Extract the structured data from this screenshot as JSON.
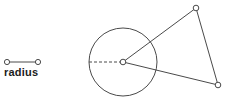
{
  "figure": {
    "width": 228,
    "height": 100,
    "background_color": "#ffffff",
    "stroke_color": "#4a4a4a",
    "text_color": "#1c1c1c",
    "marker_fill_color": "#ffffff"
  },
  "legend": {
    "label": "radius",
    "segment": {
      "x1": 7,
      "y1": 62,
      "x2": 38,
      "y2": 62
    },
    "endpoint_markers": [
      {
        "name": "legend-endpoint-left",
        "cx": 7,
        "cy": 62,
        "r": 2.6
      },
      {
        "name": "legend-endpoint-right",
        "cx": 38,
        "cy": 62,
        "r": 2.6
      }
    ]
  },
  "diagram": {
    "circle": {
      "cx": 123,
      "cy": 62,
      "r": 34
    },
    "radius_dashed_line": {
      "x1": 89,
      "y1": 62,
      "x2": 120,
      "y2": 62
    },
    "vertices": [
      {
        "name": "circle-center-vertex",
        "cx": 123,
        "cy": 62,
        "r": 2.8
      },
      {
        "name": "triangle-top-vertex",
        "cx": 196,
        "cy": 8,
        "r": 2.8
      },
      {
        "name": "triangle-bottom-right-vertex",
        "cx": 218,
        "cy": 85,
        "r": 2.8
      }
    ],
    "edges": [
      {
        "name": "edge-center-to-top",
        "x1": 123,
        "y1": 62,
        "x2": 196,
        "y2": 8
      },
      {
        "name": "edge-center-to-bottom-right",
        "x1": 123,
        "y1": 62,
        "x2": 218,
        "y2": 85
      },
      {
        "name": "edge-top-to-bottom-right",
        "x1": 196,
        "y1": 8,
        "x2": 218,
        "y2": 85
      }
    ]
  }
}
